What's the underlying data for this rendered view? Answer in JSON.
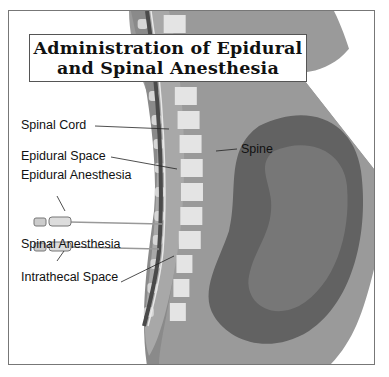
{
  "title": {
    "line1": "Administration of Epidural",
    "line2": "and Spinal Anesthesia"
  },
  "labels": {
    "spinal_cord": "Spinal Cord",
    "epidural_space": "Epidural Space",
    "epidural_anesthesia": "Epidural Anesthesia",
    "spinal_anesthesia": "Spinal Anesthesia",
    "intrathecal_space": "Intrathecal Space",
    "spine": "Spine"
  },
  "colors": {
    "body": "#9a9a9a",
    "body_dark": "#7d7d7d",
    "uterus": "#666666",
    "uterus_inner": "#7a7a7a",
    "vertebra": "#e4e4e4",
    "disc": "#b9b9b9",
    "cord": "#555555"
  }
}
